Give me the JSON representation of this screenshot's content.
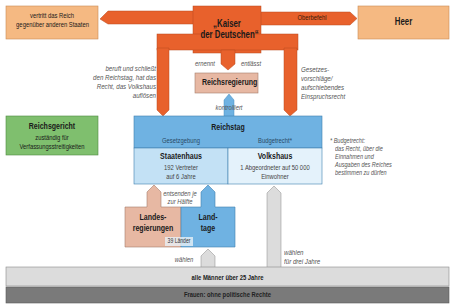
{
  "diagram": {
    "colors": {
      "kaiser_orange": "#e8612c",
      "peach": "#f5b982",
      "rose": "#e7b8a3",
      "green": "#7fbf6e",
      "blue_dark": "#6fb2e2",
      "blue_light": "#d8ecf8",
      "grey_light": "#dcdcdc",
      "grey_dark": "#7a7a7a"
    },
    "kaiser": {
      "line1": "„Kaiser",
      "line2": "der Deutschen“"
    },
    "foreign": {
      "line1": "vertritt das Reich",
      "line2": "gegenüber anderen Staaten"
    },
    "heer": {
      "label": "Heer",
      "arrow_label": "Oberbefehl"
    },
    "reichsregierung": {
      "label": "Reichsregierung",
      "ernennt": "ernennt",
      "entlaesst": "entlässt",
      "kontrolliert": "kontrolliert"
    },
    "left_note": {
      "lines": [
        "beruft und schließt",
        "den Reichstag, hat das",
        "Recht, das Volkshaus",
        "auflösen"
      ]
    },
    "right_note": {
      "lines": [
        "Gesetzes-",
        "vorschläge/",
        "aufschiebendes",
        "Einspruchsrecht"
      ]
    },
    "reichsgericht": {
      "title": "Reichsgericht",
      "line1": "zuständig für",
      "line2": "Verfassungsstreitigkeiten"
    },
    "reichstag": {
      "title": "Reichstag",
      "gesetzgebung": "Gesetzgebung",
      "budgetrecht": "Budgetrecht*",
      "staatenhaus": {
        "title": "Staatenhaus",
        "line1": "192 Vertreter",
        "line2": "auf 6 Jahre"
      },
      "volkshaus": {
        "title": "Volkshaus",
        "line1": "1 Abgeordneter auf 50 000",
        "line2": "Einwohner"
      }
    },
    "footnote": {
      "lines": [
        "* Budgetrecht:",
        "das Recht, über die",
        "Einnahmen und",
        "Ausgaben des Reiches",
        "bestimmen zu dürfen"
      ]
    },
    "entsenden": {
      "line1": "entsenden je",
      "line2": "zur Hälfte"
    },
    "landesregierungen": {
      "line1": "Landes-",
      "line2": "regierungen"
    },
    "landtage": {
      "line1": "Land-",
      "line2": "tage"
    },
    "laender": "39 Länder",
    "waehlen_left": "wählen",
    "waehlen_right": {
      "line1": "wählen",
      "line2": "für drei Jahre"
    },
    "maenner": "alle Männer über 25 Jahre",
    "frauen": "Frauen: ohne politische Rechte"
  }
}
